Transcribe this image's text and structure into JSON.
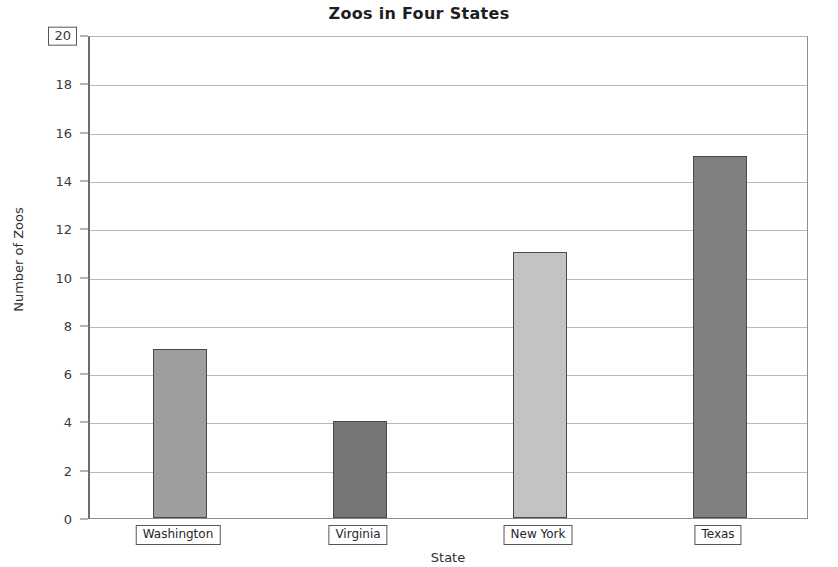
{
  "chart_data": {
    "type": "bar",
    "title": "Zoos in Four States",
    "xlabel": "State",
    "ylabel": "Number of Zoos",
    "categories": [
      "Washington",
      "Virginia",
      "New York",
      "Texas"
    ],
    "values": [
      7,
      4,
      11,
      15
    ],
    "ylim": [
      0,
      20
    ],
    "ytick_step": 2,
    "yticks": [
      0,
      2,
      4,
      6,
      8,
      10,
      12,
      14,
      16,
      18,
      20
    ],
    "ytick_labels": [
      "0",
      "2",
      "4",
      "6",
      "8",
      "10",
      "12",
      "14",
      "16",
      "18",
      "20"
    ],
    "grid": true,
    "legend": null,
    "bar_colors": [
      "#9e9e9e",
      "#767676",
      "#c3c3c3",
      "#808080"
    ],
    "selected_ytick_label": "20"
  },
  "axis": {
    "y_axis_title": "Number of Zoos",
    "x_axis_title": "State"
  }
}
